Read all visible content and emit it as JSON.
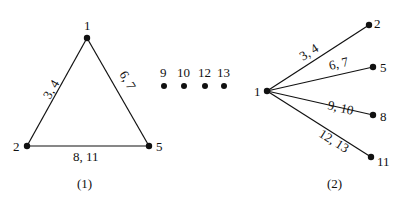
{
  "graph1": {
    "caption": "(1)",
    "nodes": [
      {
        "id": "1",
        "label": "1"
      },
      {
        "id": "2",
        "label": "2"
      },
      {
        "id": "5",
        "label": "5"
      }
    ],
    "edges": [
      {
        "from": "1",
        "to": "2",
        "label": "3, 4"
      },
      {
        "from": "1",
        "to": "5",
        "label": "6, 7"
      },
      {
        "from": "2",
        "to": "5",
        "label": "8, 11"
      }
    ]
  },
  "isolated": {
    "nodes": [
      {
        "id": "9",
        "label": "9"
      },
      {
        "id": "10",
        "label": "10"
      },
      {
        "id": "12",
        "label": "12"
      },
      {
        "id": "13",
        "label": "13"
      }
    ]
  },
  "graph2": {
    "caption": "(2)",
    "center": {
      "id": "1",
      "label": "1"
    },
    "leaves": [
      {
        "id": "2",
        "label": "2",
        "edge_label": "3, 4"
      },
      {
        "id": "5",
        "label": "5",
        "edge_label": "6, 7"
      },
      {
        "id": "8",
        "label": "8",
        "edge_label": "9, 10"
      },
      {
        "id": "11",
        "label": "11",
        "edge_label": "12, 13"
      }
    ]
  },
  "colors": {
    "stroke": "#111111",
    "background": "#ffffff"
  }
}
